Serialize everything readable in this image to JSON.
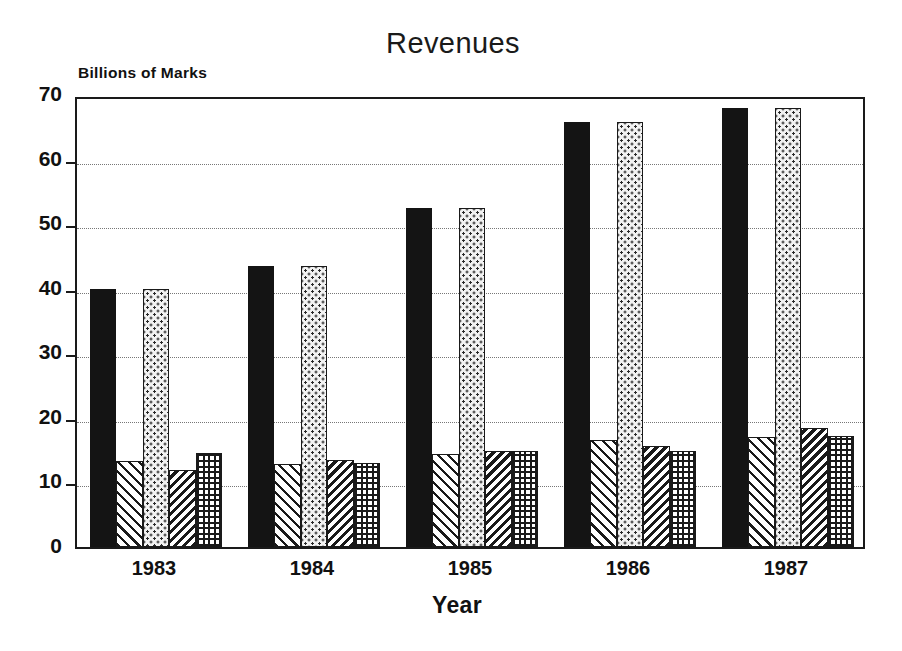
{
  "chart_data": {
    "type": "bar",
    "title": "Revenues",
    "xlabel": "Year",
    "ylabel": "Billions of Marks",
    "categories": [
      "1983",
      "1984",
      "1985",
      "1986",
      "1987"
    ],
    "ylim": [
      0,
      70
    ],
    "yticks": [
      0,
      10,
      20,
      30,
      40,
      50,
      60,
      70
    ],
    "ytick_labels": [
      "0",
      "10",
      "20",
      "30",
      "40",
      "50",
      "60",
      "70"
    ],
    "grid": true,
    "grid_axis": "y",
    "legend": false,
    "legend_position": "none",
    "series": [
      {
        "name": "series-1",
        "pattern": "solid-black",
        "values": [
          40.0,
          43.5,
          52.5,
          65.8,
          68.0
        ]
      },
      {
        "name": "series-2",
        "pattern": "diagonal-hatch",
        "values": [
          13.3,
          12.8,
          14.4,
          16.6,
          17.1
        ]
      },
      {
        "name": "series-3",
        "pattern": "light-stipple",
        "values": [
          40.0,
          43.5,
          52.5,
          65.8,
          68.0
        ]
      },
      {
        "name": "series-4",
        "pattern": "dark-back-hatch",
        "values": [
          12.0,
          13.4,
          14.8,
          15.7,
          18.5
        ]
      },
      {
        "name": "series-5",
        "pattern": "crosshatch",
        "values": [
          14.5,
          13.0,
          14.8,
          14.9,
          17.2
        ]
      }
    ]
  },
  "figure": {
    "title": "Revenues",
    "y_axis_caption": "Billions of Marks",
    "x_axis_caption": "Year"
  },
  "colors": {
    "axis": "#1a1a1a",
    "grid": "#777777",
    "background": "#ffffff",
    "series_solid": "#141414",
    "series_stipple": "#f2f2f2"
  }
}
